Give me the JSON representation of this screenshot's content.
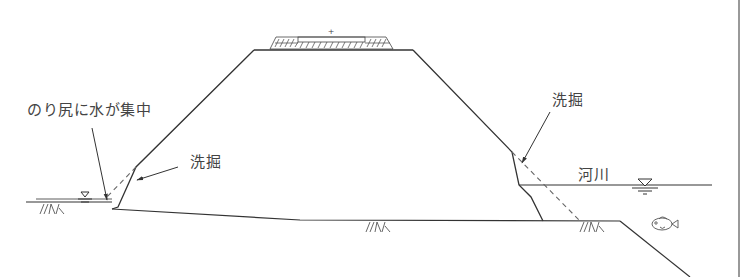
{
  "diagram": {
    "labels": {
      "toe_water": "のり尻に水が集中",
      "scour_left": "洗掘",
      "scour_right": "洗掘",
      "river": "河川"
    },
    "symbols": {
      "water_level_left": "water-level-triangle",
      "water_level_right": "water-level-triangle",
      "ground_hatch": "ground-hatch",
      "fish": "fish-icon",
      "crest_pavement": "hatched-pavement",
      "crest_mark": "+"
    },
    "colors": {
      "line": "#333333",
      "text": "#444444",
      "dashed": "#666666",
      "background": "#ffffff"
    }
  }
}
